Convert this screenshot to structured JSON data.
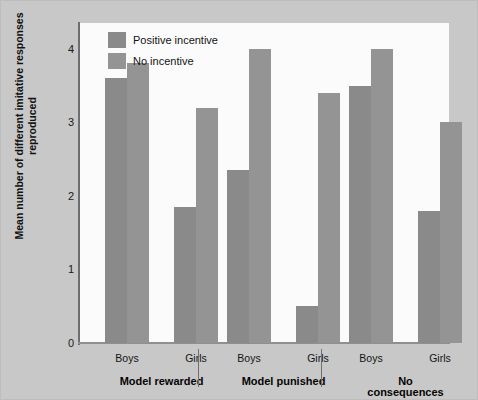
{
  "chart_data": {
    "type": "bar",
    "title": "",
    "xlabel": "",
    "ylabel": "Mean number of different imitative responses reproduced",
    "ylim": [
      0,
      4.35
    ],
    "yticks": [
      0,
      1,
      2,
      3,
      4
    ],
    "ytick_labels": [
      "0",
      "1",
      "2",
      "3",
      "4"
    ],
    "grid": false,
    "legend_position": "top-left",
    "categories": [
      "Boys",
      "Girls",
      "Boys",
      "Girls",
      "Boys",
      "Girls"
    ],
    "groups": [
      {
        "label": "Model rewarded",
        "categories": [
          "Boys",
          "Girls"
        ]
      },
      {
        "label": "Model punished",
        "categories": [
          "Boys",
          "Girls"
        ]
      },
      {
        "label": "No consequences",
        "categories": [
          "Boys",
          "Girls"
        ]
      }
    ],
    "series": [
      {
        "name": "Positive incentive",
        "color": "#8a8a8a",
        "values": [
          3.6,
          1.85,
          2.35,
          0.5,
          3.5,
          1.8
        ]
      },
      {
        "name": "No incentive",
        "color": "#949494",
        "values": [
          3.8,
          3.2,
          4.0,
          3.4,
          4.0,
          3.0
        ]
      }
    ],
    "bars": [
      {
        "group": "Model rewarded",
        "category": "Boys",
        "series": "Positive incentive",
        "value": 3.6
      },
      {
        "group": "Model rewarded",
        "category": "Boys",
        "series": "No incentive",
        "value": 3.8
      },
      {
        "group": "Model rewarded",
        "category": "Girls",
        "series": "Positive incentive",
        "value": 1.85
      },
      {
        "group": "Model rewarded",
        "category": "Girls",
        "series": "No incentive",
        "value": 3.2
      },
      {
        "group": "Model punished",
        "category": "Boys",
        "series": "Positive incentive",
        "value": 2.35
      },
      {
        "group": "Model punished",
        "category": "Boys",
        "series": "No incentive",
        "value": 4.0
      },
      {
        "group": "Model punished",
        "category": "Girls",
        "series": "Positive incentive",
        "value": 0.5
      },
      {
        "group": "Model punished",
        "category": "Girls",
        "series": "No incentive",
        "value": 3.4
      },
      {
        "group": "No consequences",
        "category": "Boys",
        "series": "Positive incentive",
        "value": 3.5
      },
      {
        "group": "No consequences",
        "category": "Boys",
        "series": "No incentive",
        "value": 4.0
      },
      {
        "group": "No consequences",
        "category": "Girls",
        "series": "Positive incentive",
        "value": 1.8
      },
      {
        "group": "No consequences",
        "category": "Girls",
        "series": "No incentive",
        "value": 3.0
      }
    ]
  },
  "legend": {
    "items": [
      {
        "label": "Positive incentive",
        "color": "#8a8a8a"
      },
      {
        "label": "No incentive",
        "color": "#949494"
      }
    ]
  },
  "colors": {
    "figure_background": "#c8c8c8",
    "plot_background": "#fbfbfb",
    "axis": "#6e6e6e",
    "series_positive": "#8a8a8a",
    "series_none": "#949494",
    "text": "#141414"
  }
}
